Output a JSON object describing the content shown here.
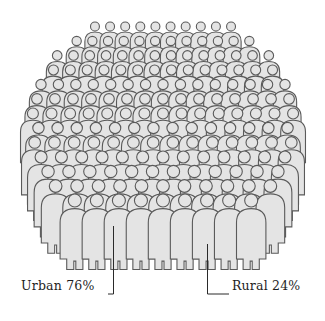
{
  "figure": {
    "colors": {
      "fill": "#e4e4e4",
      "stroke": "#5a5a5a",
      "text": "#1e1e1e",
      "background": "#ffffff"
    }
  },
  "chart_data": {
    "type": "pie",
    "title": "",
    "categories": [
      "Urban",
      "Rural"
    ],
    "values": [
      76,
      24
    ],
    "unit": "%",
    "annotations": [
      "Urban 76%",
      "Rural 24%"
    ]
  },
  "labels": {
    "urban": "Urban 76%",
    "rural": "Rural 24%"
  }
}
